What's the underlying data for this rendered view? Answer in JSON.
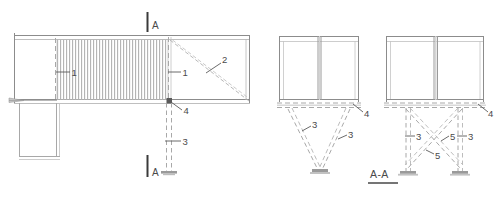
{
  "drawing": {
    "title_block": {
      "section_view_title": "A-A"
    },
    "section_markers": [
      {
        "id": "section-marker-top",
        "letter": "A"
      },
      {
        "id": "section-marker-bottom",
        "letter": "A"
      }
    ],
    "plan_view": {
      "name": "plan-view",
      "callouts": [
        {
          "key": "panel-left",
          "text": "1"
        },
        {
          "key": "panel-right",
          "text": "1"
        },
        {
          "key": "diagonal-brace",
          "text": "2"
        },
        {
          "key": "vertical-post",
          "text": "3"
        },
        {
          "key": "connection-node",
          "text": "4"
        }
      ]
    },
    "section_view_v": {
      "name": "section-view-v-brace",
      "callouts": [
        {
          "key": "brace-left",
          "text": "3"
        },
        {
          "key": "brace-right",
          "text": "3"
        },
        {
          "key": "bearing-point",
          "text": "4"
        }
      ]
    },
    "section_view_x": {
      "name": "section-view-x-brace",
      "callouts": [
        {
          "key": "leg-left",
          "text": "3"
        },
        {
          "key": "leg-right",
          "text": "3"
        },
        {
          "key": "cross-brace-lower",
          "text": "5"
        },
        {
          "key": "cross-brace-upper",
          "text": "5"
        },
        {
          "key": "bearing-point",
          "text": "4"
        }
      ]
    },
    "colors": {
      "line": "#8c8c8c",
      "line_dark": "#5a5a5a",
      "line_light": "#b8b8b8",
      "hatch": "#b0b0b0",
      "text": "#4a4a4a",
      "marker": "#3a3a3a",
      "base_plate": "#9a9a9a"
    }
  }
}
